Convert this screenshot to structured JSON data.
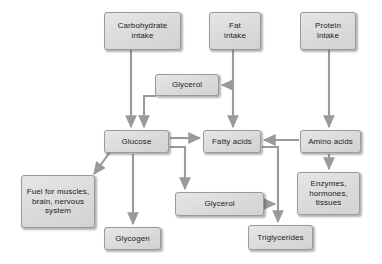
{
  "diagram": {
    "background_color": "#ffffff",
    "node_fill_color": "#dcdcdc",
    "node_border_color": "#9a9a9a",
    "arrow_color": "#8c8c8c",
    "nodes": [
      {
        "id": "carbohydrate_intake",
        "label": "Carbohydrate\nintake",
        "x": 104,
        "y": 12,
        "w": 77,
        "h": 38
      },
      {
        "id": "fat_intake",
        "label": "Fat\nintake",
        "x": 209,
        "y": 12,
        "w": 52,
        "h": 38
      },
      {
        "id": "protein_intake",
        "label": "Protein\nintake",
        "x": 300,
        "y": 12,
        "w": 56,
        "h": 38
      },
      {
        "id": "glycerol_upper",
        "label": "Glycerol",
        "x": 155,
        "y": 74,
        "w": 64,
        "h": 22
      },
      {
        "id": "glucose",
        "label": "Glucose",
        "x": 104,
        "y": 130,
        "w": 65,
        "h": 23
      },
      {
        "id": "fatty_acids",
        "label": "Fatty acids",
        "x": 203,
        "y": 130,
        "w": 58,
        "h": 23
      },
      {
        "id": "amino_acids",
        "label": "Amino acids",
        "x": 300,
        "y": 130,
        "w": 61,
        "h": 23
      },
      {
        "id": "fuel_for_muscles",
        "label": "Fuel for muscles,\nbrain, nervous\nsystem",
        "x": 21,
        "y": 175,
        "w": 74,
        "h": 53
      },
      {
        "id": "glycerol_lower",
        "label": "Glycerol",
        "x": 175,
        "y": 192,
        "w": 89,
        "h": 24
      },
      {
        "id": "enzymes_hormones_tissues",
        "label": "Enzymes,\nhormones,\ntissues",
        "x": 297,
        "y": 172,
        "w": 63,
        "h": 43
      },
      {
        "id": "glycogen",
        "label": "Glycogen",
        "x": 104,
        "y": 227,
        "w": 57,
        "h": 23
      },
      {
        "id": "triglycerides",
        "label": "Triglycerides",
        "x": 248,
        "y": 225,
        "w": 65,
        "h": 25
      }
    ],
    "edges": [
      {
        "id": "carbohydrate-to-glucose",
        "from": "carbohydrate_intake",
        "to": "glucose"
      },
      {
        "id": "fat-to-glycerol-upper",
        "from": "fat_intake",
        "to": "glycerol_upper"
      },
      {
        "id": "fat-to-fatty-acids",
        "from": "fat_intake",
        "to": "fatty_acids"
      },
      {
        "id": "protein-to-amino-acids",
        "from": "protein_intake",
        "to": "amino_acids"
      },
      {
        "id": "glycerol-upper-to-glucose",
        "from": "glycerol_upper",
        "to": "glucose"
      },
      {
        "id": "glucose-to-fatty-acids",
        "from": "glucose",
        "to": "fatty_acids"
      },
      {
        "id": "glucose-to-fuel",
        "from": "glucose",
        "to": "fuel_for_muscles"
      },
      {
        "id": "glucose-to-glycogen",
        "from": "glucose",
        "to": "glycogen"
      },
      {
        "id": "glucose-to-glycerol-lower",
        "from": "glucose",
        "to": "glycerol_lower"
      },
      {
        "id": "amino-acids-to-fatty-acids",
        "from": "amino_acids",
        "to": "fatty_acids"
      },
      {
        "id": "amino-acids-to-enzymes",
        "from": "amino_acids",
        "to": "enzymes_hormones_tissues"
      },
      {
        "id": "fatty-acids-to-triglycerides",
        "from": "fatty_acids",
        "to": "triglycerides"
      },
      {
        "id": "glycerol-lower-to-triglycerides",
        "from": "glycerol_lower",
        "to": "triglycerides"
      }
    ]
  }
}
